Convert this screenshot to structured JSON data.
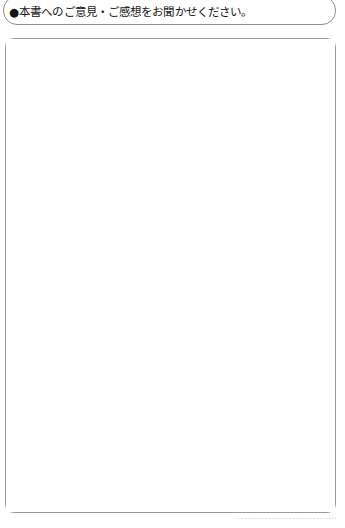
{
  "page": {
    "background_color": "#ffffff",
    "width": 345,
    "height": 528
  },
  "prompt": {
    "bullet": "●",
    "text": "●本書へのご意見・ご感想をお聞かせください。",
    "border_color": "#8e8e8e"
  },
  "answer_area": {
    "value": "",
    "placeholder": "",
    "border_color": "#9a9a9a",
    "fill_color": "#ffffff"
  },
  "footer": {
    "clipped_text": "……………………………",
    "color": "#b9b9b9"
  }
}
